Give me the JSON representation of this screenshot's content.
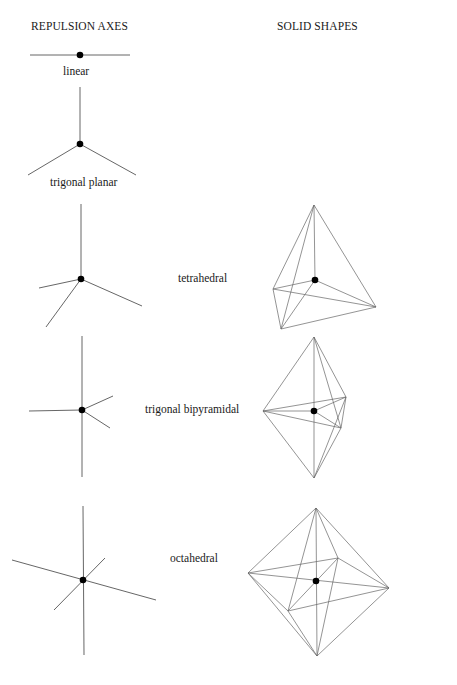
{
  "headers": {
    "left": "REPULSION AXES",
    "right": "SOLID SHAPES"
  },
  "geometries": [
    {
      "id": "linear",
      "label": "linear"
    },
    {
      "id": "trigonal-planar",
      "label": "trigonal planar"
    },
    {
      "id": "tetrahedral",
      "label": "tetrahedral"
    },
    {
      "id": "trigonal-bipyramidal",
      "label": "trigonal bipyramidal"
    },
    {
      "id": "octahedral",
      "label": "octahedral"
    }
  ]
}
